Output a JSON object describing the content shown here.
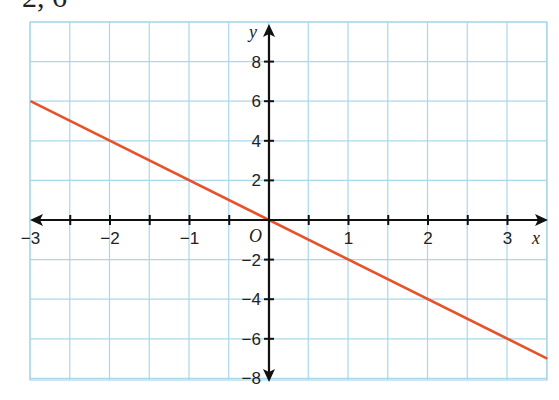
{
  "header_fragment": "2, 6",
  "colors": {
    "line": "#e8522a",
    "grid": "#a8d8ea",
    "axis": "#111111"
  },
  "chart_data": {
    "type": "line",
    "title": "",
    "xlabel": "x",
    "ylabel": "y",
    "origin_label": "O",
    "xlim": [
      -3,
      3.5
    ],
    "ylim": [
      -8,
      10
    ],
    "grid": true,
    "x_ticks": [
      -3,
      -2,
      -1,
      1,
      2,
      3
    ],
    "x_tick_labels": [
      "−3",
      "−2",
      "−1",
      "1",
      "2",
      "3"
    ],
    "y_ticks": [
      8,
      6,
      4,
      2,
      -2,
      -4,
      -6,
      -8
    ],
    "y_tick_labels": [
      "8",
      "6",
      "4",
      "2",
      "−2",
      "−4",
      "−6",
      "−8"
    ],
    "series": [
      {
        "name": "y = -2x",
        "x": [
          -3,
          3.5
        ],
        "y": [
          6,
          -7
        ]
      }
    ]
  }
}
